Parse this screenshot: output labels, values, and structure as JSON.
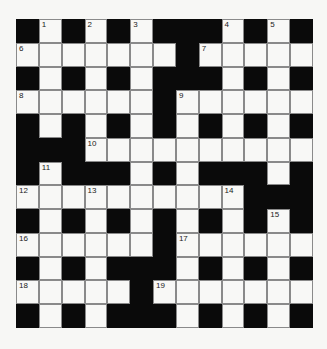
{
  "puzzle": {
    "rows": 13,
    "cols": 13,
    "grid": [
      "#.#.#.###.#.#",
      ".......#.....",
      "#.#.#.###.#.#",
      "......#......",
      "#.#.#.#.#.#.#",
      "###..........",
      "#.###.#.###.#",
      "..........###",
      "#.#.#.#.#.#.#",
      "......#......",
      "#.#.###.#.#.#",
      ".....#.......",
      "#.#.###.#.#.#"
    ],
    "numbers": [
      {
        "row": 0,
        "col": 1,
        "n": "1"
      },
      {
        "row": 0,
        "col": 3,
        "n": "2"
      },
      {
        "row": 0,
        "col": 5,
        "n": "3"
      },
      {
        "row": 0,
        "col": 9,
        "n": "4"
      },
      {
        "row": 0,
        "col": 11,
        "n": "5"
      },
      {
        "row": 1,
        "col": 0,
        "n": "6"
      },
      {
        "row": 1,
        "col": 8,
        "n": "7"
      },
      {
        "row": 3,
        "col": 0,
        "n": "8"
      },
      {
        "row": 3,
        "col": 7,
        "n": "9"
      },
      {
        "row": 5,
        "col": 3,
        "n": "10"
      },
      {
        "row": 6,
        "col": 1,
        "n": "11"
      },
      {
        "row": 7,
        "col": 0,
        "n": "12"
      },
      {
        "row": 7,
        "col": 3,
        "n": "13"
      },
      {
        "row": 7,
        "col": 9,
        "n": "14"
      },
      {
        "row": 8,
        "col": 11,
        "n": "15"
      },
      {
        "row": 9,
        "col": 0,
        "n": "16"
      },
      {
        "row": 9,
        "col": 7,
        "n": "17"
      },
      {
        "row": 11,
        "col": 0,
        "n": "18"
      },
      {
        "row": 11,
        "col": 6,
        "n": "19"
      }
    ]
  }
}
